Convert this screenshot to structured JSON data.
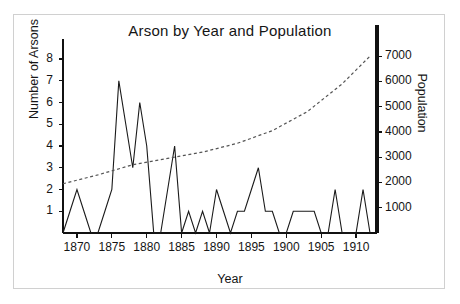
{
  "chart_data": {
    "type": "line",
    "title": "Arson by Year and Population",
    "xlabel": "Year",
    "ylabel": "Number of Arsons",
    "ylabel_secondary": "Population",
    "grid": false,
    "legend": "none",
    "xlim": [
      1868,
      1913
    ],
    "ylim": [
      0,
      8.6
    ],
    "ylim_secondary": [
      0,
      7400
    ],
    "xticks": [
      1870,
      1875,
      1880,
      1885,
      1890,
      1895,
      1900,
      1905,
      1910
    ],
    "yticks_left": [
      1,
      2,
      3,
      4,
      5,
      6,
      7,
      8
    ],
    "yticks_right": [
      1000,
      2000,
      3000,
      4000,
      5000,
      6000,
      7000
    ],
    "series": [
      {
        "name": "Number of Arsons",
        "axis": "left",
        "style": "solid",
        "color": "#1a1a1a",
        "x": [
          1868,
          1869,
          1870,
          1871,
          1872,
          1873,
          1874,
          1875,
          1876,
          1877,
          1878,
          1879,
          1880,
          1881,
          1882,
          1883,
          1884,
          1885,
          1886,
          1887,
          1888,
          1889,
          1890,
          1891,
          1892,
          1893,
          1894,
          1895,
          1896,
          1897,
          1898,
          1899,
          1900,
          1901,
          1902,
          1903,
          1904,
          1905,
          1906,
          1907,
          1908,
          1909,
          1910,
          1911,
          1912
        ],
        "values": [
          0,
          1,
          2,
          1,
          0,
          0,
          1,
          2,
          7,
          5,
          3,
          6,
          4,
          0,
          0,
          2,
          4,
          0,
          1,
          0,
          1,
          0,
          2,
          1,
          0,
          1,
          1,
          2,
          3,
          1,
          1,
          0,
          0,
          1,
          1,
          1,
          1,
          0,
          0,
          2,
          0,
          0,
          0,
          2,
          0
        ]
      },
      {
        "name": "Population",
        "axis": "right",
        "style": "dashed",
        "color": "#555555",
        "x": [
          1868,
          1873,
          1878,
          1883,
          1888,
          1893,
          1898,
          1903,
          1908,
          1912
        ],
        "values": [
          1950,
          2300,
          2700,
          2950,
          3200,
          3550,
          4050,
          4800,
          5900,
          7000
        ]
      }
    ]
  },
  "axis": {
    "left_title": "Number of Arsons",
    "right_title": "Population",
    "x_title": "Year"
  }
}
